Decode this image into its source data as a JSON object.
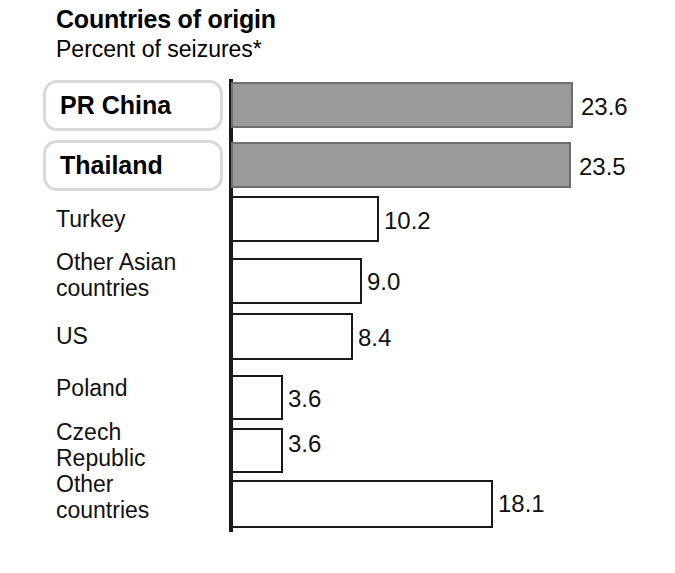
{
  "header": {
    "title": "Countries of origin",
    "subtitle": "Percent of seizures*"
  },
  "chart_data": {
    "type": "bar",
    "orientation": "horizontal",
    "title": "Countries of origin",
    "subtitle": "Percent of seizures*",
    "xlabel": "",
    "ylabel": "",
    "xlim": [
      0,
      23.6
    ],
    "grid": false,
    "legend": false,
    "axis_line": "left vertical baseline at zero",
    "value_suffix": "",
    "categories": [
      "PR China",
      "Thailand",
      "Turkey",
      "Other Asian countries",
      "US",
      "Poland",
      "Czech Republic",
      "Other countries"
    ],
    "values": [
      23.6,
      23.5,
      10.2,
      9.0,
      8.4,
      3.6,
      3.6,
      18.1
    ],
    "value_labels": [
      "23.6",
      "23.5",
      "10.2",
      "9.0",
      "8.4",
      "3.6",
      "3.6",
      "18.1"
    ],
    "highlighted": [
      "PR China",
      "Thailand"
    ],
    "colors": {
      "highlight_fill": "#9a9a9a",
      "highlight_stroke": "#6e6e6e",
      "bar_fill": "#ffffff",
      "bar_stroke": "#1a1a1a",
      "axis": "#1a1a1a",
      "text": "#111111",
      "label_box_border": "#d9d9d9",
      "background": "#ffffff"
    },
    "bars": [
      {
        "label": "PR China",
        "label_lines": "PR China",
        "value": 23.6,
        "value_label": "23.6",
        "highlighted": true,
        "top": 82,
        "height": 46,
        "width": 342,
        "label_top": 84,
        "box_top": 80,
        "box_height": 51,
        "box_width": 180,
        "value_left": 581,
        "value_top": 93
      },
      {
        "label": "Thailand",
        "label_lines": "Thailand",
        "value": 23.5,
        "value_label": "23.5",
        "highlighted": true,
        "top": 142,
        "height": 46,
        "width": 340,
        "label_top": 144,
        "box_top": 140,
        "box_height": 51,
        "box_width": 180,
        "value_left": 579,
        "value_top": 153
      },
      {
        "label": "Turkey",
        "label_lines": "Turkey",
        "value": 10.2,
        "value_label": "10.2",
        "highlighted": false,
        "top": 196,
        "height": 46,
        "width": 148,
        "label_top": 206,
        "value_left": 384,
        "value_top": 207
      },
      {
        "label": "Other Asian countries",
        "label_lines": "Other Asian\ncountries",
        "value": 9.0,
        "value_label": "9.0",
        "highlighted": false,
        "top": 258,
        "height": 46,
        "width": 131,
        "label_top": 249,
        "value_left": 367,
        "value_top": 268
      },
      {
        "label": "US",
        "label_lines": "US",
        "value": 8.4,
        "value_label": "8.4",
        "highlighted": false,
        "top": 313,
        "height": 47,
        "width": 122,
        "label_top": 323,
        "value_left": 358,
        "value_top": 324
      },
      {
        "label": "Poland",
        "label_lines": "Poland",
        "value": 3.6,
        "value_label": "3.6",
        "highlighted": false,
        "top": 375,
        "height": 45,
        "width": 52,
        "label_top": 375,
        "value_left": 288,
        "value_top": 385
      },
      {
        "label": "Czech Republic",
        "label_lines": "Czech\nRepublic",
        "value": 3.6,
        "value_label": "3.6",
        "highlighted": false,
        "top": 428,
        "height": 45,
        "width": 52,
        "label_top": 419,
        "value_left": 288,
        "value_top": 430
      },
      {
        "label": "Other countries",
        "label_lines": "Other\ncountries",
        "value": 18.1,
        "value_label": "18.1",
        "highlighted": false,
        "top": 480,
        "height": 48,
        "width": 262,
        "label_top": 471,
        "value_left": 498,
        "value_top": 490
      }
    ]
  }
}
